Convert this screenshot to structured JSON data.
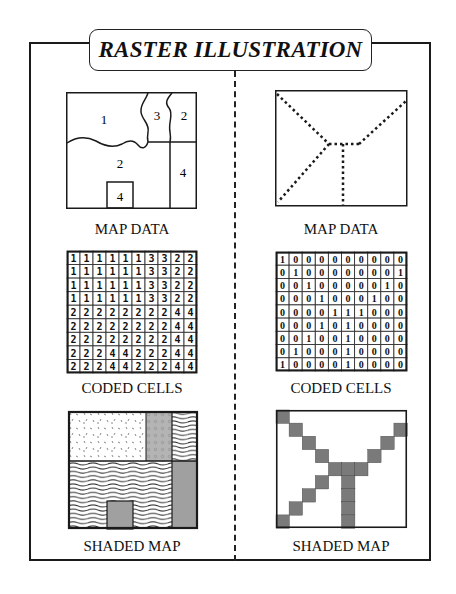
{
  "title": "RASTER ILLUSTRATION",
  "left": {
    "map_label": "MAP DATA",
    "coded_label": "CODED CELLS",
    "shaded_label": "SHADED MAP",
    "regions": [
      {
        "id": "region-1-top-left",
        "label": "1"
      },
      {
        "id": "region-3-top-middle",
        "label": "3"
      },
      {
        "id": "region-2-top-right",
        "label": "2"
      },
      {
        "id": "region-2-bottom",
        "label": "2"
      },
      {
        "id": "region-4-right",
        "label": "4"
      },
      {
        "id": "region-4-small-square",
        "label": "4"
      }
    ],
    "grid": [
      [
        1,
        1,
        1,
        1,
        1,
        1,
        3,
        3,
        2,
        2
      ],
      [
        1,
        1,
        1,
        1,
        1,
        1,
        3,
        3,
        2,
        2
      ],
      [
        1,
        1,
        1,
        1,
        1,
        1,
        3,
        3,
        2,
        2
      ],
      [
        1,
        1,
        1,
        1,
        1,
        1,
        3,
        3,
        2,
        2
      ],
      [
        2,
        2,
        2,
        2,
        2,
        2,
        2,
        2,
        4,
        4
      ],
      [
        2,
        2,
        2,
        2,
        2,
        2,
        2,
        2,
        4,
        4
      ],
      [
        2,
        2,
        2,
        2,
        2,
        2,
        2,
        2,
        4,
        4
      ],
      [
        2,
        2,
        2,
        4,
        4,
        2,
        2,
        2,
        4,
        4
      ],
      [
        2,
        2,
        2,
        4,
        4,
        2,
        2,
        2,
        4,
        4
      ]
    ]
  },
  "right": {
    "map_label": "MAP DATA",
    "coded_label": "CODED CELLS",
    "shaded_label": "SHADED MAP",
    "grid": [
      [
        1,
        0,
        0,
        0,
        0,
        0,
        0,
        0,
        0,
        0
      ],
      [
        0,
        1,
        0,
        0,
        0,
        0,
        0,
        0,
        0,
        1
      ],
      [
        0,
        0,
        1,
        0,
        0,
        0,
        0,
        0,
        1,
        0
      ],
      [
        0,
        0,
        0,
        1,
        0,
        0,
        0,
        1,
        0,
        0
      ],
      [
        0,
        0,
        0,
        0,
        1,
        1,
        1,
        0,
        0,
        0
      ],
      [
        0,
        0,
        0,
        1,
        0,
        1,
        0,
        0,
        0,
        0
      ],
      [
        0,
        0,
        1,
        0,
        0,
        1,
        0,
        0,
        0,
        0
      ],
      [
        0,
        1,
        0,
        0,
        0,
        1,
        0,
        0,
        0,
        0
      ],
      [
        1,
        0,
        0,
        0,
        0,
        1,
        0,
        0,
        0,
        0
      ]
    ]
  },
  "colors": {
    "line": "#1a1a1a",
    "shade_gray": "#9a9a9a",
    "shade_dark": "#7a7a7a"
  }
}
